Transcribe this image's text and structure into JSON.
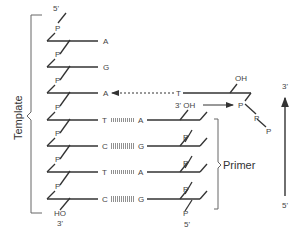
{
  "diagram": {
    "template": {
      "label": "Template",
      "top_end": "5'",
      "bottom_end": "3'",
      "bottom_group": "HO",
      "bases": [
        "A",
        "G",
        "A",
        "T",
        "C",
        "T",
        "C"
      ],
      "phosphate_label": "P"
    },
    "primer": {
      "label": "Primer",
      "bases": [
        "A",
        "G",
        "A",
        "G"
      ],
      "bottom_end": "5'",
      "top_group": "3' OH",
      "phosphate_label": "P"
    },
    "incoming_nucleotide": {
      "base": "T",
      "oh_label": "OH",
      "phosphates": [
        "P",
        "P",
        "P"
      ]
    },
    "direction_arrow": {
      "top": "3'",
      "bottom": "5'"
    }
  }
}
